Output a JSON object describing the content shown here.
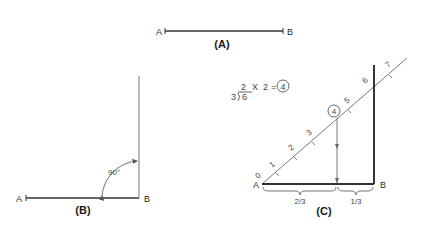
{
  "figure_a": {
    "caption": "(A)",
    "point_a": "A",
    "point_b": "B"
  },
  "figure_b": {
    "caption": "(B)",
    "point_a": "A",
    "point_b": "B",
    "angle_label": "90°"
  },
  "equation": {
    "divisor": "3",
    "dividend": "6",
    "quotient": "2",
    "times": "X",
    "multiplier": "2",
    "equals": "=",
    "result": "4"
  },
  "figure_c": {
    "caption": "(C)",
    "point_a": "A",
    "point_b": "B",
    "scale_marks": [
      "0",
      "1",
      "2",
      "3",
      "4",
      "5",
      "6",
      "7"
    ],
    "circled_mark": "4",
    "segment_left": "2/3",
    "segment_right": "1/3"
  }
}
